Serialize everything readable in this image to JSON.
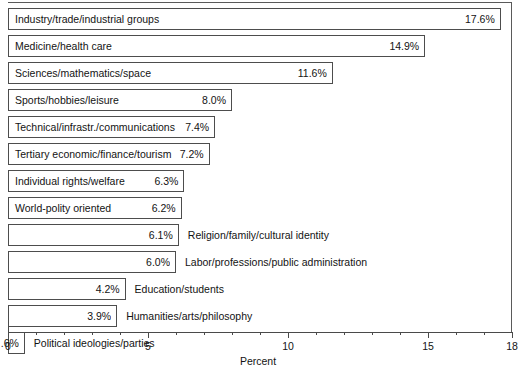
{
  "chart_data": {
    "type": "bar",
    "orientation": "horizontal",
    "title": "",
    "xlabel": "Percent",
    "ylabel": "",
    "xlim": [
      0,
      18
    ],
    "grid": false,
    "legend": null,
    "axis_ticks_major": [
      0,
      5,
      10,
      15,
      18
    ],
    "axis_tick_labels": [
      "0",
      "5",
      "10",
      "15",
      "18"
    ],
    "axis_ticks_minor_step": 1,
    "categories": [
      "Industry/trade/industrial groups",
      "Medicine/health care",
      "Sciences/mathematics/space",
      "Sports/hobbies/leisure",
      "Technical/infrastr./communications",
      "Tertiary economic/finance/tourism",
      "Individual rights/welfare",
      "World-polity oriented",
      "Religion/family/cultural identity",
      "Labor/professions/public administration",
      "Education/students",
      "Humanities/arts/philosophy",
      "Political ideologies/parties"
    ],
    "values": [
      17.6,
      14.9,
      11.6,
      8.0,
      7.4,
      7.2,
      6.3,
      6.2,
      6.1,
      6.0,
      4.2,
      3.9,
      0.6
    ],
    "value_labels": [
      "17.6%",
      "14.9%",
      "11.6%",
      "8.0%",
      "7.4%",
      "7.2%",
      "6.3%",
      "6.2%",
      "6.1%",
      "6.0%",
      "4.2%",
      "3.9%",
      ".6%"
    ]
  },
  "bars": [
    {
      "label": "Industry/trade/industrial groups",
      "value": 17.6,
      "value_label": "17.6%",
      "label_position": "inside"
    },
    {
      "label": "Medicine/health care",
      "value": 14.9,
      "value_label": "14.9%",
      "label_position": "inside"
    },
    {
      "label": "Sciences/mathematics/space",
      "value": 11.6,
      "value_label": "11.6%",
      "label_position": "inside"
    },
    {
      "label": "Sports/hobbies/leisure",
      "value": 8.0,
      "value_label": "8.0%",
      "label_position": "inside"
    },
    {
      "label": "Technical/infrastr./communications",
      "value": 7.4,
      "value_label": "7.4%",
      "label_position": "inside"
    },
    {
      "label": "Tertiary economic/finance/tourism",
      "value": 7.2,
      "value_label": "7.2%",
      "label_position": "inside"
    },
    {
      "label": "Individual rights/welfare",
      "value": 6.3,
      "value_label": "6.3%",
      "label_position": "inside"
    },
    {
      "label": "World-polity oriented",
      "value": 6.2,
      "value_label": "6.2%",
      "label_position": "inside"
    },
    {
      "label": "Religion/family/cultural identity",
      "value": 6.1,
      "value_label": "6.1%",
      "label_position": "outside"
    },
    {
      "label": "Labor/professions/public administration",
      "value": 6.0,
      "value_label": "6.0%",
      "label_position": "outside"
    },
    {
      "label": "Education/students",
      "value": 4.2,
      "value_label": "4.2%",
      "label_position": "outside"
    },
    {
      "label": "Humanities/arts/philosophy",
      "value": 3.9,
      "value_label": "3.9%",
      "label_position": "outside"
    },
    {
      "label": "Political ideologies/parties",
      "value": 0.6,
      "value_label": ".6%",
      "label_position": "outside"
    }
  ],
  "axis": {
    "title": "Percent",
    "ticks": [
      {
        "value": 0,
        "label": "0",
        "major": true
      },
      {
        "value": 1,
        "label": "",
        "major": false
      },
      {
        "value": 2,
        "label": "",
        "major": false
      },
      {
        "value": 3,
        "label": "",
        "major": false
      },
      {
        "value": 4,
        "label": "",
        "major": false
      },
      {
        "value": 5,
        "label": "5",
        "major": true
      },
      {
        "value": 6,
        "label": "",
        "major": false
      },
      {
        "value": 7,
        "label": "",
        "major": false
      },
      {
        "value": 8,
        "label": "",
        "major": false
      },
      {
        "value": 9,
        "label": "",
        "major": false
      },
      {
        "value": 10,
        "label": "10",
        "major": true
      },
      {
        "value": 11,
        "label": "",
        "major": false
      },
      {
        "value": 12,
        "label": "",
        "major": false
      },
      {
        "value": 13,
        "label": "",
        "major": false
      },
      {
        "value": 14,
        "label": "",
        "major": false
      },
      {
        "value": 15,
        "label": "15",
        "major": true
      },
      {
        "value": 16,
        "label": "",
        "major": false
      },
      {
        "value": 17,
        "label": "",
        "major": false
      },
      {
        "value": 18,
        "label": "18",
        "major": true
      }
    ]
  },
  "colors": {
    "bar_fill": "#ffffff",
    "bar_border": "#4d4d4d",
    "axis": "#4a4a4a",
    "text": "#131313",
    "background": "#ffffff"
  },
  "layout": {
    "origin_x": 8,
    "px_per_unit": 28,
    "row_pitch": 27,
    "bar_height": 22,
    "first_bar_top": 8,
    "axis_y": 332
  }
}
